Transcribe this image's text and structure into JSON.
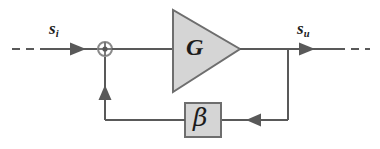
{
  "diagram": {
    "type": "block-diagram",
    "canvas": {
      "width": 380,
      "height": 149,
      "background": "#ffffff"
    },
    "colors": {
      "line": "#595959",
      "block_fill": "#d5d5d5",
      "block_stroke": "#6e6e6e",
      "text": "#1c1c1c"
    },
    "labels": {
      "input_signal": "s",
      "input_signal_sub": "i",
      "output_signal": "s",
      "output_signal_sub": "u",
      "gain_block": "G",
      "feedback_block": "β",
      "summing_junction": "⊕"
    },
    "nodes": [
      {
        "id": "input-port",
        "kind": "dashed-lead",
        "label": "s_i",
        "x1": 12,
        "y1": 49,
        "x2": 45,
        "y2": 49
      },
      {
        "id": "summing-junction",
        "kind": "circle-sum",
        "symbol": "⊕",
        "cx": 105,
        "cy": 49,
        "r": 7
      },
      {
        "id": "gain-block",
        "kind": "triangle-amplifier",
        "label": "G",
        "x": 172,
        "y": 10,
        "width": 68,
        "height": 82
      },
      {
        "id": "feedback-block",
        "kind": "rect-block",
        "label": "β",
        "x": 185,
        "y": 103,
        "width": 36,
        "height": 34
      },
      {
        "id": "output-tap",
        "kind": "junction-dot",
        "cx": 288,
        "cy": 49
      },
      {
        "id": "output-port",
        "kind": "dashed-lead",
        "label": "s_u",
        "x1": 337,
        "y1": 49,
        "x2": 370,
        "y2": 49
      }
    ],
    "edges": [
      {
        "id": "edge-input-to-sum",
        "from": "input-port",
        "to": "summing-junction",
        "arrow": "right",
        "arrow_at": [
          82,
          49
        ]
      },
      {
        "id": "edge-sum-to-gain",
        "from": "summing-junction",
        "to": "gain-block",
        "arrow": "none"
      },
      {
        "id": "edge-gain-to-output",
        "from": "gain-block",
        "to": "output-port",
        "arrow": "right",
        "arrow_at": [
          314,
          49
        ]
      },
      {
        "id": "edge-output-tap-down",
        "from": "output-tap",
        "to": "feedback-return",
        "arrow": "none"
      },
      {
        "id": "edge-feedback-right-to-beta",
        "from": "output-tap",
        "to": "feedback-block",
        "arrow": "left",
        "arrow_at": [
          262,
          120
        ]
      },
      {
        "id": "edge-beta-to-sum-corner",
        "from": "feedback-block",
        "to": "summing-junction",
        "arrow": "up",
        "arrow_at": [
          105,
          86
        ]
      }
    ]
  }
}
